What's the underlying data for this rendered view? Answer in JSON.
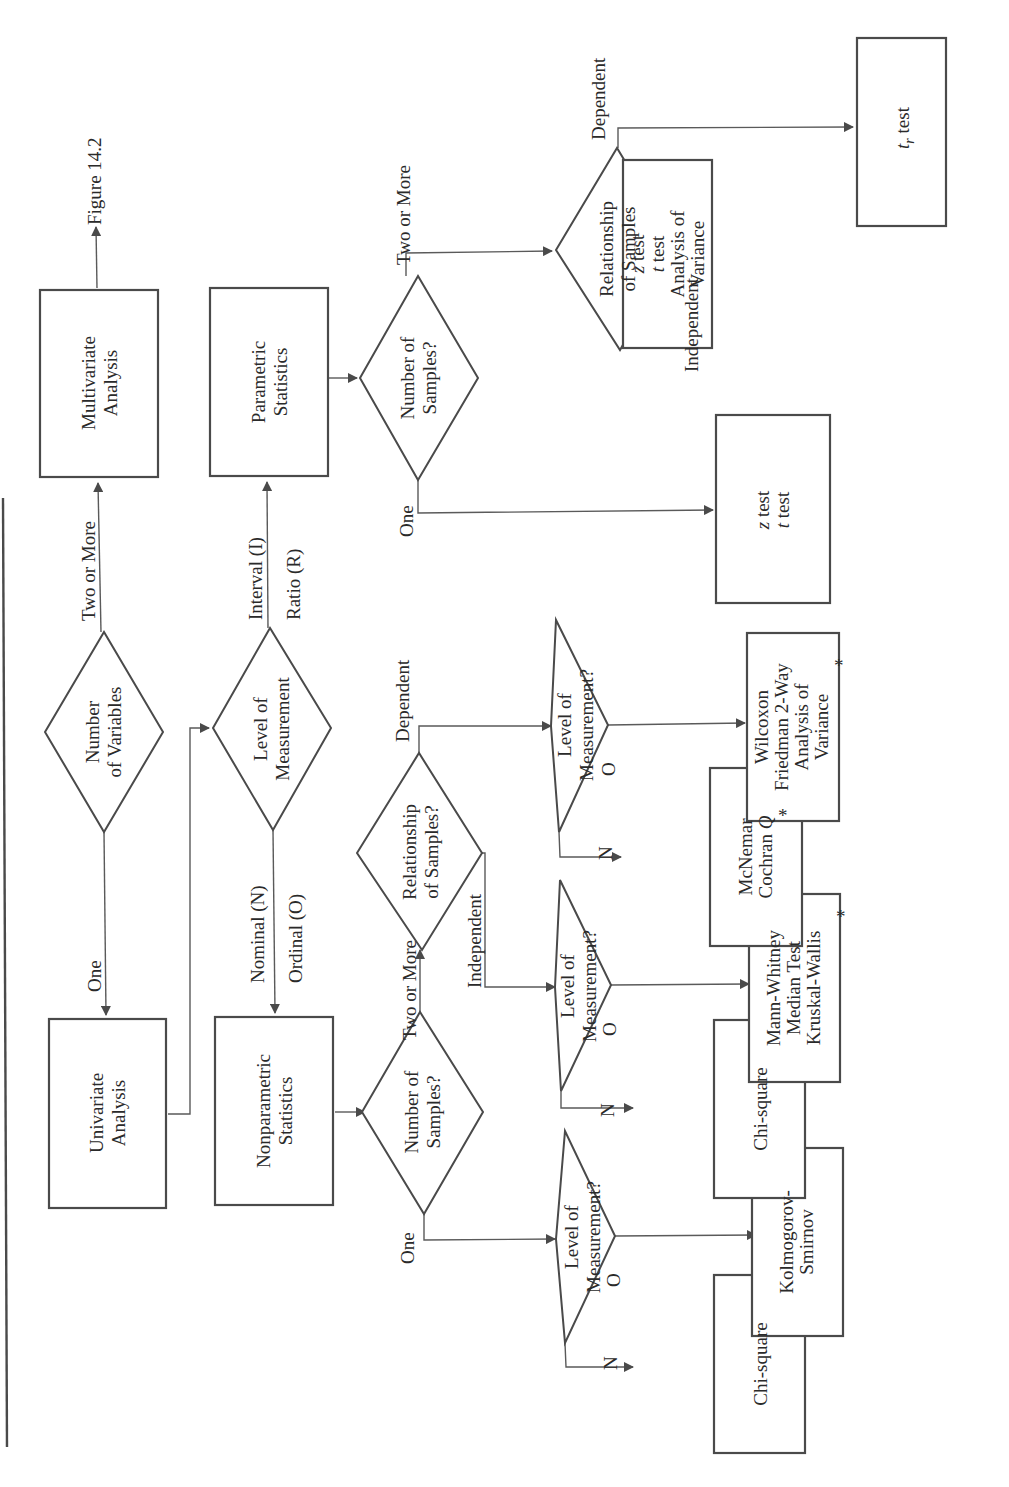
{
  "figure": {
    "orientation": "rotated-90-ccw",
    "continuation_label": "Figure 14.2"
  },
  "nodes": {
    "number_of_variables": [
      "Number",
      "of Variables"
    ],
    "univariate": [
      "Univariate",
      "Analysis"
    ],
    "multivariate": [
      "Multivariate",
      "Analysis"
    ],
    "level_top": [
      "Level of",
      "Measurement"
    ],
    "nonparametric": [
      "Nonparametric",
      "Statistics"
    ],
    "parametric": [
      "Parametric",
      "Statistics"
    ],
    "np_num_samples": [
      "Number of",
      "Samples?"
    ],
    "p_num_samples": [
      "Number of",
      "Samples?"
    ],
    "np_relationship": [
      "Relationship",
      "of Samples?"
    ],
    "p_relationship": [
      "Relationship",
      "of Samples"
    ],
    "np_one_level": [
      "Level of",
      "Measurement?"
    ],
    "np_indep_level": [
      "Level of",
      "Measurement?"
    ],
    "np_dep_level": [
      "Level of",
      "Measurement?"
    ],
    "r_chi_square_one": [
      "Chi-square"
    ],
    "r_kolmogorov": [
      "Kolmogorov-",
      "Smirnov"
    ],
    "r_chi_square_indep": [
      "Chi-square"
    ],
    "r_mann_whitney": [
      "Mann-Whitney",
      "Median Test",
      "Kruskal-Wallis"
    ],
    "r_mcnemar": [
      "McNemar",
      "Cochran Q"
    ],
    "r_wilcoxon": [
      "Wilcoxon",
      "Friedman 2-Way",
      "Analysis of",
      "Variance"
    ],
    "r_z_t_one": [
      "z test",
      "t test"
    ],
    "r_z_t_anova": [
      "z test",
      "t test",
      "Analysis of",
      "Variance"
    ],
    "r_tr_test": [
      "t",
      "r",
      " test"
    ]
  },
  "edges": {
    "one": "One",
    "two_or_more": "Two or More",
    "nominal": "Nominal (N)",
    "ordinal": "Ordinal (O)",
    "interval": "Interval (I)",
    "ratio": "Ratio (R)",
    "independent": "Independent",
    "dependent": "Dependent",
    "n": "N",
    "o": "O"
  },
  "footnote_marker": "*"
}
